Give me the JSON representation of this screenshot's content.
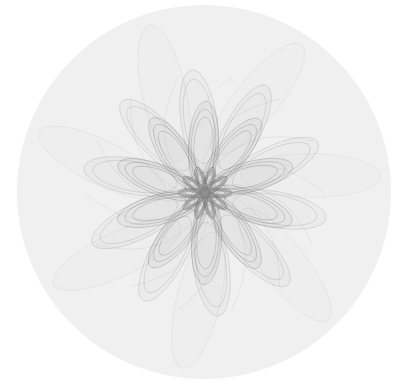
{
  "canvas": {
    "width": 399,
    "height": 388,
    "background": "#ffffff"
  },
  "disc": {
    "cx": 204,
    "cy": 192,
    "r": 187,
    "fill": "#f0f0f0"
  },
  "flower": {
    "cx": 205,
    "cy": 193,
    "stroke": "#6e6e6e",
    "rings": [
      {
        "count": 10,
        "dist": 14,
        "rx": 13,
        "ry": 5,
        "rotation": 0,
        "opacity": 0.55,
        "lines": 4
      },
      {
        "count": 10,
        "dist": 48,
        "rx": 44,
        "ry": 15,
        "rotation": 12,
        "opacity": 0.32,
        "lines": 3
      },
      {
        "count": 10,
        "dist": 72,
        "rx": 52,
        "ry": 18,
        "rotation": -8,
        "opacity": 0.22,
        "lines": 2
      },
      {
        "count": 7,
        "dist": 110,
        "rx": 70,
        "ry": 22,
        "rotation": 25,
        "opacity": 0.1,
        "lines": 1
      }
    ],
    "swirl_lines": 14
  }
}
